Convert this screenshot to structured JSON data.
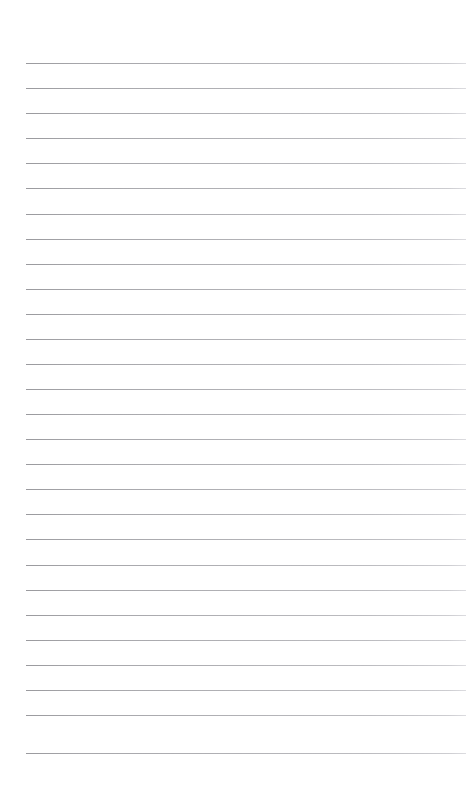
{
  "document": {
    "kind": "ruled-notepad-page",
    "title": "Blank Ruled Paper",
    "caption": "Blank lined notebook page",
    "written_text": "",
    "page_number": ""
  },
  "canvas": {
    "width": 473,
    "height": 794,
    "background_color": "#ffffff"
  },
  "ruling": {
    "line_count": 28,
    "first_line_y": 63,
    "line_spacing": 25,
    "line_thickness": 1,
    "line_left": 26,
    "line_right": 466,
    "line_color_left": "#9a9a9e",
    "line_color_right": "#dcdce0",
    "top_margin": 63,
    "bottom_margin": 41,
    "left_margin": 26,
    "right_margin": 7,
    "has_vertical_margin_rule": false,
    "lines": [
      {
        "index": 1,
        "y": 63
      },
      {
        "index": 2,
        "y": 88
      },
      {
        "index": 3,
        "y": 113
      },
      {
        "index": 4,
        "y": 138
      },
      {
        "index": 5,
        "y": 163
      },
      {
        "index": 6,
        "y": 188
      },
      {
        "index": 7,
        "y": 214
      },
      {
        "index": 8,
        "y": 239
      },
      {
        "index": 9,
        "y": 264
      },
      {
        "index": 10,
        "y": 289
      },
      {
        "index": 11,
        "y": 314
      },
      {
        "index": 12,
        "y": 339
      },
      {
        "index": 13,
        "y": 364
      },
      {
        "index": 14,
        "y": 389
      },
      {
        "index": 15,
        "y": 414
      },
      {
        "index": 16,
        "y": 439
      },
      {
        "index": 17,
        "y": 464
      },
      {
        "index": 18,
        "y": 489
      },
      {
        "index": 19,
        "y": 514
      },
      {
        "index": 20,
        "y": 539
      },
      {
        "index": 21,
        "y": 565
      },
      {
        "index": 22,
        "y": 590
      },
      {
        "index": 23,
        "y": 615
      },
      {
        "index": 24,
        "y": 640
      },
      {
        "index": 25,
        "y": 665
      },
      {
        "index": 26,
        "y": 690
      },
      {
        "index": 27,
        "y": 715
      },
      {
        "index": 28,
        "y": 753
      }
    ]
  }
}
